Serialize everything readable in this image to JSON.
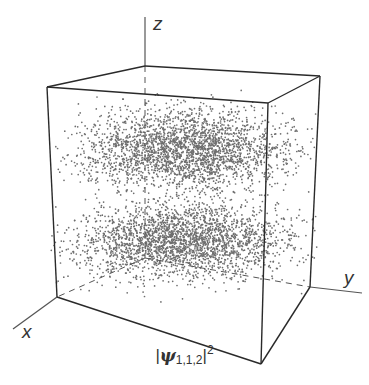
{
  "figure": {
    "type": "3d-scatter-probability-density",
    "caption": {
      "prefix": "|",
      "symbol": "ψ",
      "subscript": "1,1,2",
      "suffix": "|",
      "superscript": "2"
    },
    "axes": {
      "x_label": "x",
      "y_label": "y",
      "z_label": "z"
    },
    "colors": {
      "edge": "#2a2a2a",
      "axis": "#555555",
      "dot": "#6e6e6e",
      "background": "#ffffff"
    },
    "box": {
      "top_front_left": [
        47,
        87
      ],
      "top_back_left": [
        145,
        66
      ],
      "top_back_right": [
        320,
        76
      ],
      "top_front_right": [
        268,
        103
      ],
      "bottom_front_left": [
        57,
        297
      ],
      "bottom_back_left": [
        145,
        258
      ],
      "bottom_back_right": [
        310,
        287
      ],
      "bottom_front_right": [
        261,
        364
      ]
    },
    "density": {
      "lobes": 2,
      "description": "Two horizontal density lobes (upper and lower) with a sparse nodal plane between them",
      "upper_lobe_center": [
        185,
        150
      ],
      "lower_lobe_center": [
        185,
        240
      ],
      "approx_dot_count": 5000
    }
  }
}
